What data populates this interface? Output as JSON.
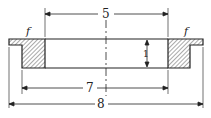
{
  "diagram": {
    "type": "cross-section drawing of a flanged ring",
    "dimensions": {
      "top_width": "5",
      "inner_width": "7",
      "overall_width": "8",
      "height": "1"
    },
    "annotations": {
      "left_surface": "f",
      "right_surface": "f"
    }
  }
}
